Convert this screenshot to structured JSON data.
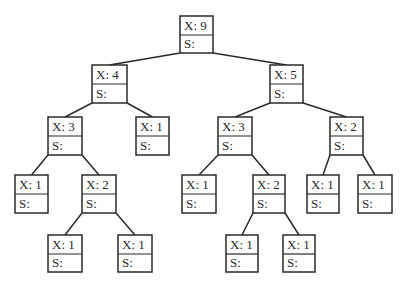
{
  "diagram": {
    "type": "binary-tree",
    "line_color": "#2a2a2a",
    "nodes": [
      {
        "id": "n0",
        "x_label": "X: 9",
        "s_label": "S:",
        "box": [
          180,
          16,
          33,
          37
        ],
        "parent": null
      },
      {
        "id": "n1",
        "x_label": "X: 4",
        "s_label": "S:",
        "box": [
          92,
          65,
          35,
          38
        ],
        "parent": "n0",
        "side": "left"
      },
      {
        "id": "n2",
        "x_label": "X: 5",
        "s_label": "S:",
        "box": [
          270,
          65,
          33,
          38
        ],
        "parent": "n0",
        "side": "right"
      },
      {
        "id": "n3",
        "x_label": "X: 3",
        "s_label": "S:",
        "box": [
          48,
          117,
          34,
          38
        ],
        "parent": "n1",
        "side": "left"
      },
      {
        "id": "n4",
        "x_label": "X: 1",
        "s_label": "S:",
        "box": [
          136,
          117,
          33,
          38
        ],
        "parent": "n1",
        "side": "right"
      },
      {
        "id": "n5",
        "x_label": "X: 3",
        "s_label": "S:",
        "box": [
          218,
          117,
          34,
          38
        ],
        "parent": "n2",
        "side": "left"
      },
      {
        "id": "n6",
        "x_label": "X: 2",
        "s_label": "S:",
        "box": [
          330,
          117,
          33,
          38
        ],
        "parent": "n2",
        "side": "right"
      },
      {
        "id": "n7",
        "x_label": "X: 1",
        "s_label": "S:",
        "box": [
          15,
          175,
          33,
          38
        ],
        "parent": "n3",
        "side": "left"
      },
      {
        "id": "n8",
        "x_label": "X: 2",
        "s_label": "S:",
        "box": [
          82,
          175,
          34,
          38
        ],
        "parent": "n3",
        "side": "right"
      },
      {
        "id": "n9",
        "x_label": "X: 1",
        "s_label": "S:",
        "box": [
          182,
          175,
          34,
          38
        ],
        "parent": "n5",
        "side": "left"
      },
      {
        "id": "n10",
        "x_label": "X: 2",
        "s_label": "S:",
        "box": [
          253,
          175,
          32,
          38
        ],
        "parent": "n5",
        "side": "right"
      },
      {
        "id": "n11",
        "x_label": "X: 1",
        "s_label": "S:",
        "box": [
          307,
          175,
          32,
          38
        ],
        "parent": "n6",
        "side": "left"
      },
      {
        "id": "n12",
        "x_label": "X: 1",
        "s_label": "S:",
        "box": [
          358,
          175,
          34,
          38
        ],
        "parent": "n6",
        "side": "right"
      },
      {
        "id": "n13",
        "x_label": "X: 1",
        "s_label": "S:",
        "box": [
          48,
          235,
          34,
          37
        ],
        "parent": "n8",
        "side": "left"
      },
      {
        "id": "n14",
        "x_label": "X: 1",
        "s_label": "S:",
        "box": [
          118,
          235,
          34,
          37
        ],
        "parent": "n8",
        "side": "right"
      },
      {
        "id": "n15",
        "x_label": "X: 1",
        "s_label": "S:",
        "box": [
          226,
          235,
          32,
          37
        ],
        "parent": "n10",
        "side": "left"
      },
      {
        "id": "n16",
        "x_label": "X: 1",
        "s_label": "S:",
        "box": [
          283,
          235,
          32,
          37
        ],
        "parent": "n10",
        "side": "right"
      }
    ]
  }
}
